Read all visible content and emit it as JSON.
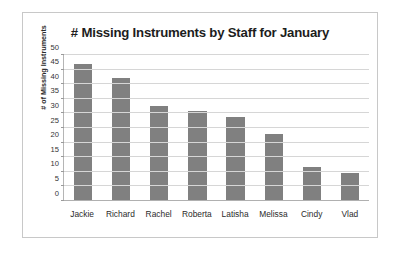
{
  "chart_data": {
    "type": "bar",
    "title": "# Missing Instruments by Staff for January",
    "xlabel": "",
    "ylabel": "# of Missing Instruments",
    "categories": [
      "Jackie",
      "Richard",
      "Rachel",
      "Roberta",
      "Latisha",
      "Melissa",
      "Cindy",
      "Vlad"
    ],
    "values": [
      47,
      42,
      32.7,
      30.7,
      28.7,
      23,
      11.5,
      9.7
    ],
    "ylim": [
      0,
      50
    ],
    "yticks": [
      0,
      5,
      10,
      15,
      20,
      25,
      30,
      35,
      40,
      45,
      50
    ],
    "ytick_labels": [
      "0",
      "5",
      "10",
      "15",
      "20",
      "25",
      "30",
      "35",
      "40",
      "45",
      "50"
    ],
    "grid": true,
    "legend": false,
    "series": [
      {
        "name": "# of Missing Instruments",
        "color": "#808080",
        "values": [
          47,
          42,
          32.7,
          30.7,
          28.7,
          23,
          11.5,
          9.7
        ]
      }
    ]
  },
  "style": {
    "bar_color": "#808080",
    "grid_color": "#d6d6d6",
    "axis_color": "#b0b0b0",
    "border_color": "#c8c8c8",
    "background": "#ffffff",
    "title_color": "#1d1d1d"
  }
}
